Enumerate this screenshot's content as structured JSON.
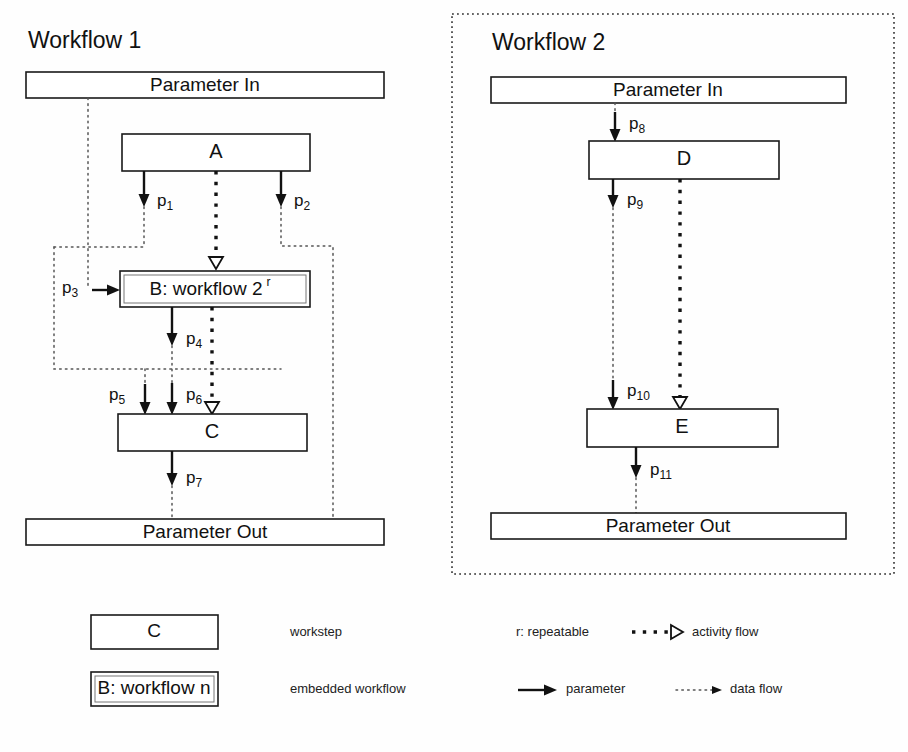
{
  "diagram": {
    "workflows": [
      {
        "id": "workflow-1",
        "title": "Workflow 1",
        "param_in": "Parameter In",
        "param_out": "Parameter Out",
        "steps": [
          {
            "id": "A",
            "label": "A",
            "type": "workstep"
          },
          {
            "id": "B",
            "label": "B: workflow 2",
            "superscript": "r",
            "type": "embedded-workflow"
          },
          {
            "id": "C",
            "label": "C",
            "type": "workstep"
          }
        ]
      },
      {
        "id": "workflow-2",
        "title": "Workflow 2",
        "param_in": "Parameter In",
        "param_out": "Parameter Out",
        "steps": [
          {
            "id": "D",
            "label": "D",
            "type": "workstep"
          },
          {
            "id": "E",
            "label": "E",
            "type": "workstep"
          }
        ]
      }
    ],
    "parameters": [
      {
        "name": "p1",
        "base": "p",
        "sub": "1"
      },
      {
        "name": "p2",
        "base": "p",
        "sub": "2"
      },
      {
        "name": "p3",
        "base": "p",
        "sub": "3"
      },
      {
        "name": "p4",
        "base": "p",
        "sub": "4"
      },
      {
        "name": "p5",
        "base": "p",
        "sub": "5"
      },
      {
        "name": "p6",
        "base": "p",
        "sub": "6"
      },
      {
        "name": "p7",
        "base": "p",
        "sub": "7"
      },
      {
        "name": "p8",
        "base": "p",
        "sub": "8"
      },
      {
        "name": "p9",
        "base": "p",
        "sub": "9"
      },
      {
        "name": "p10",
        "base": "p",
        "sub": "10"
      },
      {
        "name": "p11",
        "base": "p",
        "sub": "11"
      }
    ]
  },
  "legend": {
    "items": [
      {
        "key": "workstep",
        "sample_label": "C",
        "text": "workstep"
      },
      {
        "key": "embedded-workflow",
        "sample_label": "B: workflow n",
        "text": "embedded workflow"
      },
      {
        "key": "repeatable",
        "text": "r: repeatable"
      },
      {
        "key": "parameter",
        "text": "parameter"
      },
      {
        "key": "activity-flow",
        "text": "activity flow"
      },
      {
        "key": "data-flow",
        "text": "data flow"
      }
    ]
  },
  "colors": {
    "background": "#fefefe",
    "stroke": "#111111",
    "data_flow": "#555555",
    "workflow_border": "#333333"
  }
}
